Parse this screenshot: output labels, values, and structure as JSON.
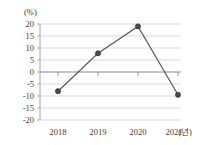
{
  "chart_data": {
    "type": "line",
    "title": "",
    "subtitle": "",
    "xlabel": "(년)",
    "ylabel": "(%)",
    "categories": [
      "2018",
      "2019",
      "2020",
      "2021"
    ],
    "values": [
      -8,
      7.8,
      19,
      -9.5
    ],
    "series": [
      {
        "name": "",
        "values": [
          -8,
          7.8,
          19,
          -9.5
        ]
      }
    ],
    "ylim": [
      -20,
      20
    ],
    "ytick_labels": [
      "20",
      "15",
      "10",
      "5",
      "0",
      "-5",
      "-10",
      "-15",
      "-20"
    ],
    "ytick_values": [
      20,
      15,
      10,
      5,
      0,
      -5,
      -10,
      -15,
      -20
    ],
    "xtick_labels": [
      "2018",
      "2019",
      "2020",
      "2021"
    ],
    "grid": true,
    "legend": "none",
    "marker": "filled-circle",
    "line_color": "#5a5a66",
    "marker_color": "#4a4a55",
    "grid_color": "#c8c8c8",
    "zero_line_color": "#8a8a8a",
    "background_color": "#ffffff"
  }
}
